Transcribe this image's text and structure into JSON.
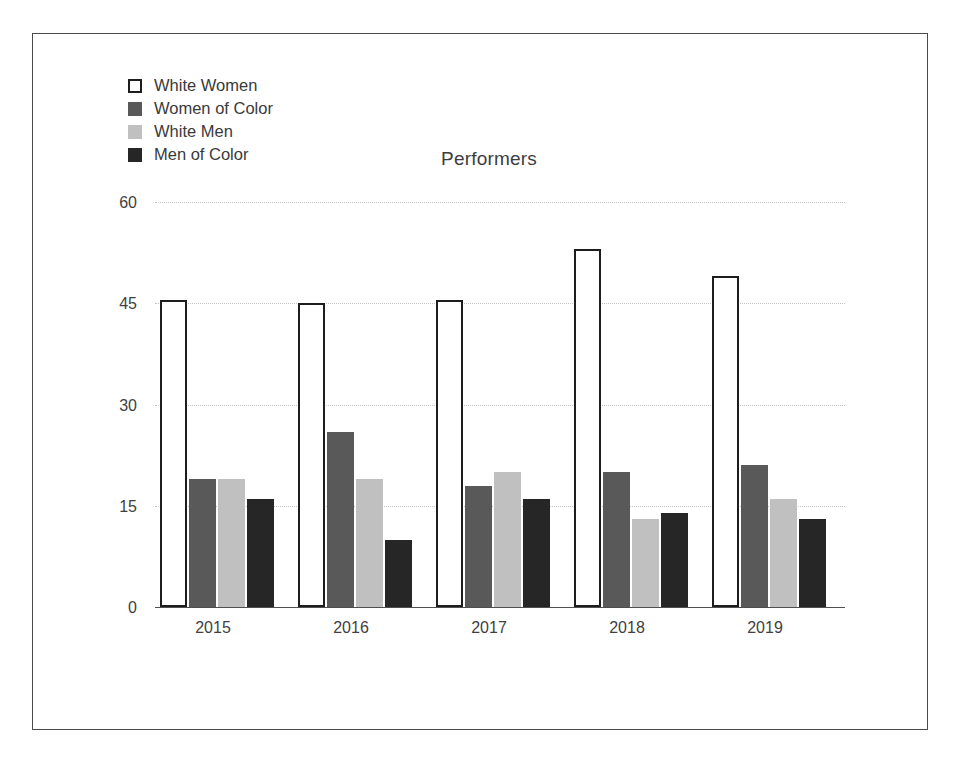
{
  "chart_data": {
    "type": "bar",
    "title": "Performers",
    "xlabel": "",
    "ylabel": "",
    "categories": [
      "2015",
      "2016",
      "2017",
      "2018",
      "2019"
    ],
    "ylim": [
      0,
      60
    ],
    "yticks": [
      0,
      15,
      30,
      45,
      60
    ],
    "grid": true,
    "legend_position": "top-left",
    "series": [
      {
        "name": "White Women",
        "color": "#ffffff",
        "edge_color": "#1d1d1d",
        "values": [
          45.5,
          45,
          45.5,
          53,
          49
        ]
      },
      {
        "name": "Women of Color",
        "color": "#595959",
        "edge_color": "#595959",
        "values": [
          19,
          26,
          18,
          20,
          21
        ]
      },
      {
        "name": "White Men",
        "color": "#c0c0c0",
        "edge_color": "#c0c0c0",
        "values": [
          19,
          19,
          20,
          13,
          16
        ]
      },
      {
        "name": "Men of Color",
        "color": "#262626",
        "edge_color": "#262626",
        "values": [
          16,
          10,
          16,
          14,
          13
        ]
      }
    ]
  },
  "legend": {
    "items": [
      {
        "label": "White Women"
      },
      {
        "label": "Women of Color"
      },
      {
        "label": "White Men"
      },
      {
        "label": "Men of Color"
      }
    ]
  },
  "yticks": {
    "t0": "60",
    "t1": "45",
    "t2": "30",
    "t3": "15",
    "t4": "0"
  },
  "xticks": {
    "t0": "2015",
    "t1": "2016",
    "t2": "2017",
    "t3": "2018",
    "t4": "2019"
  }
}
